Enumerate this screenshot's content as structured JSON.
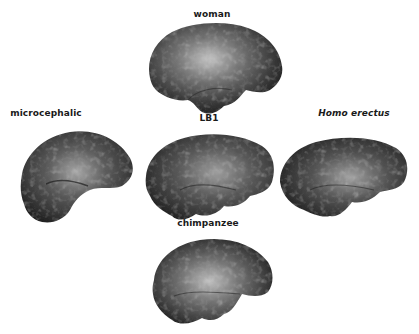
{
  "figure": {
    "type": "comparative endocast renderings (lateral view)",
    "specimens": [
      {
        "id": "woman",
        "label": "woman",
        "italic": false,
        "label_pos": [
          212,
          15
        ],
        "shape_box": [
          140,
          20,
          146,
          98
        ]
      },
      {
        "id": "microcephalic",
        "label": "microcephalic",
        "italic": false,
        "label_pos": [
          46,
          114
        ],
        "shape_box": [
          8,
          124,
          128,
          104
        ]
      },
      {
        "id": "lb1",
        "label": "LB1",
        "italic": false,
        "label_pos": [
          209,
          119
        ],
        "shape_box": [
          140,
          128,
          138,
          96
        ]
      },
      {
        "id": "homo-erectus",
        "label": "Homo erectus",
        "italic": true,
        "label_pos": [
          354,
          114
        ],
        "shape_box": [
          276,
          126,
          140,
          98
        ]
      },
      {
        "id": "chimpanzee",
        "label": "chimpanzee",
        "italic": false,
        "label_pos": [
          208,
          224
        ],
        "shape_box": [
          140,
          234,
          138,
          96
        ]
      }
    ],
    "colors": {
      "background": "#ffffff",
      "label_text": "#1a1a1a",
      "surface_dark": "#1e1e1e",
      "surface_mid": "#5a5a5a",
      "surface_light": "#b8b8b8"
    }
  }
}
